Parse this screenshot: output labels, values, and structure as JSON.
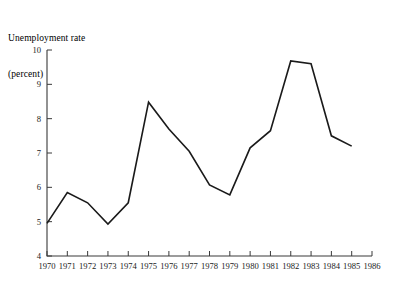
{
  "figure": {
    "title_line1": "Unemployment rate",
    "title_line2": "(percent)"
  },
  "chart_data": {
    "type": "line",
    "title": "Unemployment rate (percent)",
    "xlabel": "",
    "ylabel": "Unemployment rate (percent)",
    "categories": [
      "1970",
      "1971",
      "1972",
      "1973",
      "1974",
      "1975",
      "1976",
      "1977",
      "1978",
      "1979",
      "1980",
      "1981",
      "1982",
      "1983",
      "1984",
      "1985"
    ],
    "x": [
      1970,
      1971,
      1972,
      1973,
      1974,
      1975,
      1976,
      1977,
      1978,
      1979,
      1980,
      1981,
      1982,
      1983,
      1984,
      1985
    ],
    "values": [
      4.95,
      5.85,
      5.55,
      4.93,
      5.55,
      8.48,
      7.7,
      7.05,
      6.07,
      5.78,
      7.15,
      7.65,
      9.68,
      9.6,
      7.5,
      7.2
    ],
    "series": [
      {
        "name": "Unemployment rate",
        "values": [
          4.95,
          5.85,
          5.55,
          4.93,
          5.55,
          8.48,
          7.7,
          7.05,
          6.07,
          5.78,
          7.15,
          7.65,
          9.68,
          9.6,
          7.5,
          7.2
        ],
        "color": "#1a1a1a"
      }
    ],
    "xlim": [
      1970,
      1986
    ],
    "ylim": [
      4,
      10
    ],
    "xticks": [
      1970,
      1971,
      1972,
      1973,
      1974,
      1975,
      1976,
      1977,
      1978,
      1979,
      1980,
      1981,
      1982,
      1983,
      1984,
      1985,
      1986
    ],
    "xtick_labels": [
      "1970",
      "1971",
      "1972",
      "1973",
      "1974",
      "1975",
      "1976",
      "1977",
      "1978",
      "1979",
      "1980",
      "1981",
      "1982",
      "1983",
      "1984",
      "1985",
      "1986"
    ],
    "yticks": [
      4,
      5,
      6,
      7,
      8,
      9,
      10
    ],
    "ytick_labels": [
      "4",
      "5",
      "6",
      "7",
      "8",
      "9",
      "10"
    ],
    "grid": false,
    "legend": false,
    "legend_position": "none"
  },
  "colors": {
    "line": "#1a1a1a",
    "axis": "#3a3a3a",
    "background": "#ffffff"
  }
}
